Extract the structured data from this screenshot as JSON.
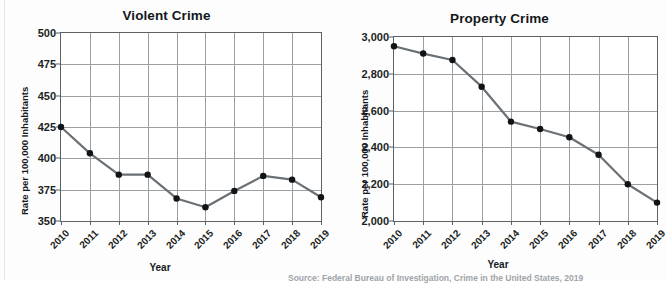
{
  "figure": {
    "source_note": "Source: Federal Bureau of Investigation, Crime in the United States, 2019"
  },
  "chart_data": [
    {
      "type": "line",
      "title": "Violent Crime",
      "xlabel": "Year",
      "ylabel": "Rate per 100,000 Inhabitants",
      "categories": [
        "2010",
        "2011",
        "2012",
        "2013",
        "2014",
        "2015",
        "2016",
        "2017",
        "2018",
        "2019"
      ],
      "values": [
        425,
        404,
        387,
        387,
        368,
        361,
        374,
        386,
        383,
        369
      ],
      "ylim": [
        350,
        500
      ],
      "yticks": [
        "350",
        "375",
        "400",
        "425",
        "450",
        "475",
        "500"
      ],
      "ytick_values": [
        350,
        375,
        400,
        425,
        450,
        475,
        500
      ],
      "grid": true,
      "legend": "none",
      "line_color": "#6b7074",
      "marker_color": "#111417"
    },
    {
      "type": "line",
      "title": "Property Crime",
      "xlabel": "Year",
      "ylabel": "Rate per 100,000 Inhabitants",
      "categories": [
        "2010",
        "2011",
        "2012",
        "2013",
        "2014",
        "2015",
        "2016",
        "2017",
        "2018",
        "2019"
      ],
      "values": [
        2950,
        2910,
        2875,
        2730,
        2540,
        2500,
        2455,
        2360,
        2200,
        2100
      ],
      "ylim": [
        2000,
        3000
      ],
      "yticks": [
        "2,000",
        "2,200",
        "2,400",
        "2,600",
        "2,800",
        "3,000"
      ],
      "ytick_values": [
        2000,
        2200,
        2400,
        2600,
        2800,
        3000
      ],
      "grid": true,
      "legend": "none",
      "line_color": "#6b7074",
      "marker_color": "#111417"
    }
  ]
}
